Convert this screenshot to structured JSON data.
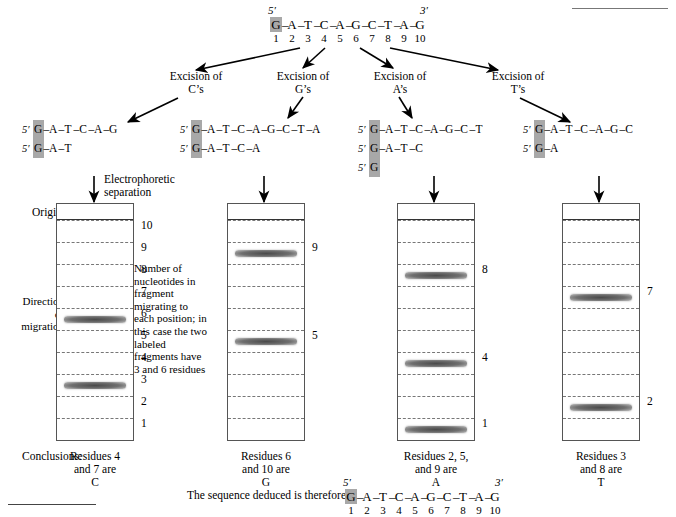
{
  "figure": {
    "top_sequence": {
      "five_prime": "5′",
      "three_prime": "3′",
      "bases": [
        "G",
        "A",
        "T",
        "C",
        "A",
        "G",
        "C",
        "T",
        "A",
        "G"
      ],
      "numbers": [
        "1",
        "2",
        "3",
        "4",
        "5",
        "6",
        "7",
        "8",
        "9",
        "10"
      ],
      "highlight_index": 0
    },
    "excisions": [
      {
        "line1": "Excision of",
        "line2": "C’s"
      },
      {
        "line1": "Excision of",
        "line2": "G’s"
      },
      {
        "line1": "Excision of",
        "line2": "A’s"
      },
      {
        "line1": "Excision of",
        "line2": "T’s"
      }
    ],
    "fragment_sets": [
      {
        "tag": "5′",
        "fragments": [
          [
            "G",
            "A",
            "T",
            "C",
            "A",
            "G"
          ],
          [
            "G",
            "A",
            "T"
          ]
        ]
      },
      {
        "tag": "5′",
        "fragments": [
          [
            "G",
            "A",
            "T",
            "C",
            "A",
            "G",
            "C",
            "T",
            "A"
          ],
          [
            "G",
            "A",
            "T",
            "C",
            "A"
          ]
        ]
      },
      {
        "tag": "5′",
        "fragments": [
          [
            "G",
            "A",
            "T",
            "C",
            "A",
            "G",
            "C",
            "T"
          ],
          [
            "G",
            "A",
            "T",
            "C"
          ],
          [
            "G"
          ]
        ]
      },
      {
        "tag": "5′",
        "fragments": [
          [
            "G",
            "A",
            "T",
            "C",
            "A",
            "G",
            "C"
          ],
          [
            "G",
            "A"
          ]
        ]
      }
    ],
    "separation_label": {
      "line1": "Electrophoretic",
      "line2": "separation"
    },
    "origin_label": "Origin",
    "direction_label": {
      "line1": "Direction",
      "line2": "of",
      "line3": "migration"
    },
    "note": "Number of nucleotides in fragment migrating to each position; in this case the two labeled fragments have 3 and 6 residues",
    "gels": [
      {
        "lane_numbers": [
          "10",
          "9",
          "8",
          "7",
          "6",
          "5",
          "4",
          "3",
          "2",
          "1"
        ],
        "labeled_lanes": [
          "6",
          "3"
        ],
        "bands": [
          6,
          3
        ]
      },
      {
        "lane_numbers": [
          "10",
          "9",
          "8",
          "7",
          "6",
          "5",
          "4",
          "3",
          "2",
          "1"
        ],
        "labeled_lanes": [
          "9",
          "5"
        ],
        "bands": [
          9,
          5
        ]
      },
      {
        "lane_numbers": [
          "10",
          "9",
          "8",
          "7",
          "6",
          "5",
          "4",
          "3",
          "2",
          "1"
        ],
        "labeled_lanes": [
          "8",
          "4",
          "1"
        ],
        "bands": [
          8,
          4,
          1
        ]
      },
      {
        "lane_numbers": [
          "10",
          "9",
          "8",
          "7",
          "6",
          "5",
          "4",
          "3",
          "2",
          "1"
        ],
        "labeled_lanes": [
          "7",
          "2"
        ],
        "bands": [
          7,
          2
        ]
      }
    ],
    "conclusions_label": "Conclusions:",
    "conclusions": [
      {
        "line1": "Residues 4",
        "line2": "and 7 are",
        "line3": "C"
      },
      {
        "line1": "Residues 6",
        "line2": "and 10 are",
        "line3": "G"
      },
      {
        "line1": "Residues 2, 5,",
        "line2": "and 9 are",
        "line3": "A"
      },
      {
        "line1": "Residues 3",
        "line2": "and 8 are",
        "line3": "T"
      }
    ],
    "deduced": {
      "label": "The sequence deduced is therefore:",
      "five_prime": "5′",
      "three_prime": "3′",
      "bases": [
        "G",
        "A",
        "T",
        "C",
        "A",
        "G",
        "C",
        "T",
        "A",
        "G"
      ],
      "numbers": [
        "1",
        "2",
        "3",
        "4",
        "5",
        "6",
        "7",
        "8",
        "9",
        "10"
      ],
      "highlight_index": 0
    },
    "colors": {
      "label_highlight": "#a8a8a8",
      "band": "#6d6d6d",
      "gel_border": "#555555",
      "lane_divider": "#777777"
    }
  }
}
